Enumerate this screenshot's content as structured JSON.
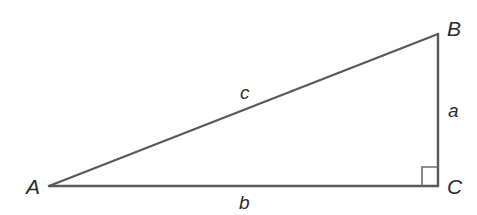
{
  "diagram": {
    "type": "right-triangle",
    "vertices": [
      {
        "id": "A",
        "label": "A",
        "x": 49,
        "y": 186
      },
      {
        "id": "B",
        "label": "B",
        "x": 438,
        "y": 34
      },
      {
        "id": "C",
        "label": "C",
        "x": 438,
        "y": 186
      }
    ],
    "sides": [
      {
        "id": "a",
        "label": "a",
        "from": "B",
        "to": "C"
      },
      {
        "id": "b",
        "label": "b",
        "from": "A",
        "to": "C"
      },
      {
        "id": "c",
        "label": "c",
        "from": "A",
        "to": "B"
      }
    ],
    "right_angle_at": "C",
    "line_color": "#5a5a5a",
    "label_color": "#2a2a2a"
  }
}
